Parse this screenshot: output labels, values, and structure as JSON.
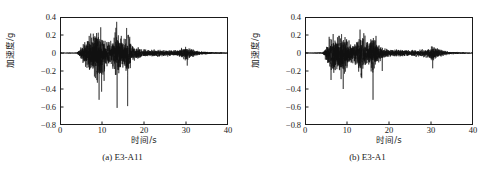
{
  "figure": {
    "background_color": "#ffffff",
    "line_color": "#111111",
    "axis_color": "#1a1a1a"
  },
  "panels": [
    {
      "id": "panel-a",
      "caption": "(a) E3-A11",
      "chart_data": {
        "type": "line",
        "title": "",
        "subtitle": "",
        "xlabel": "时间/s",
        "ylabel": "加速度/g",
        "xlim": [
          0,
          40
        ],
        "ylim": [
          -0.8,
          0.4
        ],
        "xticks": [
          0,
          10,
          20,
          30,
          40
        ],
        "xtick_labels": [
          "0",
          "10",
          "20",
          "30",
          "40"
        ],
        "yticks": [
          0.4,
          0.2,
          0,
          -0.2,
          -0.4,
          -0.6,
          -0.8
        ],
        "ytick_labels": [
          "0.4",
          "0.2",
          "0",
          "−0.2",
          "−0.4",
          "−0.6",
          "−0.8"
        ],
        "grid": false,
        "legend": null,
        "legend_position": "none",
        "annotations": [],
        "series": [
          {
            "name": "E3-A11 acceleration",
            "sample_rate_hz": 50,
            "duration_s": 40,
            "peak_positive_g": 0.28,
            "peak_negative_g": -0.61,
            "peak_positive_time_s": 13.4,
            "peak_negative_time_s": 13.6,
            "envelope": [
              {
                "t": 0.0,
                "amp": 0.004
              },
              {
                "t": 4.0,
                "amp": 0.006
              },
              {
                "t": 4.8,
                "amp": 0.06
              },
              {
                "t": 5.6,
                "amp": 0.13
              },
              {
                "t": 6.4,
                "amp": 0.2
              },
              {
                "t": 7.2,
                "amp": 0.23
              },
              {
                "t": 8.0,
                "amp": 0.26
              },
              {
                "t": 8.8,
                "amp": 0.34
              },
              {
                "t": 9.6,
                "amp": 0.3
              },
              {
                "t": 10.4,
                "amp": 0.22
              },
              {
                "t": 11.2,
                "amp": 0.16
              },
              {
                "t": 12.0,
                "amp": 0.14
              },
              {
                "t": 12.8,
                "amp": 0.2
              },
              {
                "t": 13.4,
                "amp": 0.38
              },
              {
                "t": 14.2,
                "amp": 0.22
              },
              {
                "t": 15.0,
                "amp": 0.16
              },
              {
                "t": 16.0,
                "amp": 0.3
              },
              {
                "t": 17.0,
                "amp": 0.12
              },
              {
                "t": 18.0,
                "amp": 0.08
              },
              {
                "t": 20.0,
                "amp": 0.05
              },
              {
                "t": 22.0,
                "amp": 0.045
              },
              {
                "t": 25.0,
                "amp": 0.04
              },
              {
                "t": 28.0,
                "amp": 0.035
              },
              {
                "t": 30.0,
                "amp": 0.09
              },
              {
                "t": 31.0,
                "amp": 0.06
              },
              {
                "t": 33.0,
                "amp": 0.025
              },
              {
                "t": 36.0,
                "amp": 0.012
              },
              {
                "t": 40.0,
                "amp": 0.005
              }
            ],
            "spikes": [
              {
                "t": 8.9,
                "g": -0.33
              },
              {
                "t": 9.3,
                "g": -0.52
              },
              {
                "t": 9.9,
                "g": -0.43
              },
              {
                "t": 10.5,
                "g": -0.31
              },
              {
                "t": 13.3,
                "g": 0.28
              },
              {
                "t": 13.6,
                "g": -0.61
              },
              {
                "t": 14.6,
                "g": 0.19
              },
              {
                "t": 16.1,
                "g": -0.59
              },
              {
                "t": 16.6,
                "g": 0.18
              },
              {
                "t": 30.3,
                "g": -0.14
              }
            ]
          }
        ]
      }
    },
    {
      "id": "panel-b",
      "caption": "(b) E3-A1",
      "chart_data": {
        "type": "line",
        "title": "",
        "subtitle": "",
        "xlabel": "时间/s",
        "ylabel": "加速度/g",
        "xlim": [
          0,
          40
        ],
        "ylim": [
          -0.8,
          0.4
        ],
        "xticks": [
          0,
          10,
          20,
          30,
          40
        ],
        "xtick_labels": [
          "0",
          "10",
          "20",
          "30",
          "40"
        ],
        "yticks": [
          0.4,
          0.2,
          0,
          -0.2,
          -0.4,
          -0.6,
          -0.8
        ],
        "ytick_labels": [
          "0.4",
          "0.2",
          "0",
          "−0.2",
          "−0.4",
          "−0.6",
          "−0.8"
        ],
        "grid": false,
        "legend": null,
        "legend_position": "none",
        "annotations": [],
        "series": [
          {
            "name": "E3-A1 acceleration",
            "sample_rate_hz": 50,
            "duration_s": 40,
            "peak_positive_g": 0.26,
            "peak_negative_g": -0.52,
            "peak_positive_time_s": 13.2,
            "peak_negative_time_s": 16.2,
            "envelope": [
              {
                "t": 0.0,
                "amp": 0.004
              },
              {
                "t": 4.2,
                "amp": 0.008
              },
              {
                "t": 5.0,
                "amp": 0.08
              },
              {
                "t": 5.8,
                "amp": 0.22
              },
              {
                "t": 6.6,
                "amp": 0.26
              },
              {
                "t": 7.4,
                "amp": 0.2
              },
              {
                "t": 8.2,
                "amp": 0.24
              },
              {
                "t": 9.0,
                "amp": 0.28
              },
              {
                "t": 9.8,
                "amp": 0.2
              },
              {
                "t": 10.6,
                "amp": 0.14
              },
              {
                "t": 11.4,
                "amp": 0.11
              },
              {
                "t": 12.2,
                "amp": 0.14
              },
              {
                "t": 13.2,
                "amp": 0.28
              },
              {
                "t": 14.0,
                "amp": 0.22
              },
              {
                "t": 15.0,
                "amp": 0.14
              },
              {
                "t": 16.2,
                "amp": 0.26
              },
              {
                "t": 17.2,
                "amp": 0.12
              },
              {
                "t": 18.5,
                "amp": 0.07
              },
              {
                "t": 20.0,
                "amp": 0.05
              },
              {
                "t": 23.0,
                "amp": 0.045
              },
              {
                "t": 26.0,
                "amp": 0.04
              },
              {
                "t": 29.0,
                "amp": 0.05
              },
              {
                "t": 30.4,
                "amp": 0.1
              },
              {
                "t": 31.5,
                "amp": 0.06
              },
              {
                "t": 34.0,
                "amp": 0.02
              },
              {
                "t": 37.0,
                "amp": 0.01
              },
              {
                "t": 40.0,
                "amp": 0.005
              }
            ],
            "spikes": [
              {
                "t": 6.2,
                "g": -0.3
              },
              {
                "t": 8.6,
                "g": -0.29
              },
              {
                "t": 9.1,
                "g": -0.4
              },
              {
                "t": 9.4,
                "g": -0.23
              },
              {
                "t": 13.1,
                "g": 0.26
              },
              {
                "t": 13.5,
                "g": -0.28
              },
              {
                "t": 14.0,
                "g": 0.22
              },
              {
                "t": 16.2,
                "g": -0.52
              },
              {
                "t": 16.9,
                "g": 0.19
              },
              {
                "t": 18.4,
                "g": -0.2
              },
              {
                "t": 30.4,
                "g": -0.17
              }
            ]
          }
        ]
      }
    }
  ]
}
